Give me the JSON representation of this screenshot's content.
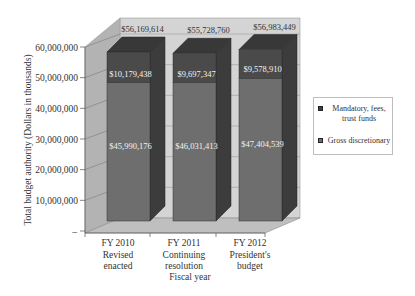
{
  "chart_data": {
    "type": "bar",
    "stacked": true,
    "three_d": true,
    "title": "",
    "xlabel": "Fiscal year",
    "ylabel": "Total budget authority (Dollars in thousands)",
    "ylim": [
      0,
      60000000
    ],
    "yticks": [
      "–",
      "10,000,000",
      "20,000,000",
      "30,000,000",
      "40,000,000",
      "50,000,000",
      "60,000,000"
    ],
    "categories": [
      [
        "FY 2010",
        "Revised",
        "enacted"
      ],
      [
        "FY 2011",
        "Continuing",
        "resolution"
      ],
      [
        "FY 2012",
        "President's",
        "budget"
      ]
    ],
    "series": [
      {
        "name": "Gross discretionary",
        "color": "#6e6e6e",
        "values": [
          45990176,
          46031413,
          47404539
        ],
        "labels": [
          "$45,990,176",
          "$46,031,413",
          "$47,404,539"
        ]
      },
      {
        "name": "Mandatory, fees, trust funds",
        "color": "#4a4a4a",
        "values": [
          10179438,
          9697347,
          9578910
        ],
        "labels": [
          "$10,179,438",
          "$9,697,347",
          "$9,578,910"
        ]
      }
    ],
    "totals": [
      56169614,
      55728760,
      56983449
    ],
    "total_labels": [
      "$56,169,614",
      "$55,728,760",
      "$56,983,449"
    ],
    "grid": true,
    "legend_position": "right"
  },
  "legend": {
    "items": [
      {
        "label_line1": "Mandatory, fees,",
        "label_line2": "trust funds",
        "color": "#3f3f3f"
      },
      {
        "label_line1": "Gross discretionary",
        "label_line2": "",
        "color": "#6e6e6e"
      }
    ]
  }
}
